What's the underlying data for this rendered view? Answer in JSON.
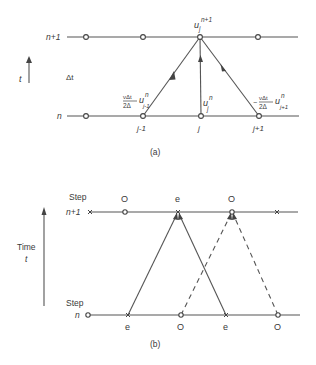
{
  "diagram_a": {
    "caption": "(a)",
    "time_axis_label": "t",
    "delta_label": "Δt",
    "levels": [
      {
        "label": "n+1",
        "y": 37
      },
      {
        "label": "n",
        "y": 116
      }
    ],
    "top_node_label": {
      "base": "u",
      "sub": "j",
      "sup": "n+1"
    },
    "center_node_label": {
      "base": "u",
      "sub": "j",
      "sup": "n"
    },
    "left_coef": {
      "num": "νΔt",
      "den": "2Δ",
      "base": "u",
      "sub": "j-1",
      "sup": "n"
    },
    "right_coef": {
      "sign": "−",
      "num": "νΔt",
      "den": "2Δ",
      "base": "u",
      "sub": "j+1",
      "sup": "n"
    },
    "grid_labels": [
      "j-1",
      "j",
      "j+1"
    ],
    "nodes_top_x": [
      86,
      143,
      200,
      258
    ],
    "nodes_bottom_x": [
      86,
      143,
      201,
      259
    ]
  },
  "diagram_b": {
    "caption": "(b)",
    "time_axis_label": "Time",
    "time_symbol": "t",
    "top_step": {
      "word": "Step",
      "label": "n+1"
    },
    "bottom_step": {
      "word": "Step",
      "label": "n"
    },
    "top_marks": [
      {
        "x": 90,
        "type": "cross",
        "label": ""
      },
      {
        "x": 125,
        "type": "circle",
        "label": "O"
      },
      {
        "x": 178,
        "type": "cross",
        "label": "e"
      },
      {
        "x": 232,
        "type": "circle",
        "label": "O"
      },
      {
        "x": 277,
        "type": "cross",
        "label": ""
      }
    ],
    "bottom_marks": [
      {
        "x": 88,
        "type": "circle",
        "label": ""
      },
      {
        "x": 128,
        "type": "cross",
        "label": "e"
      },
      {
        "x": 181,
        "type": "circle",
        "label": "O"
      },
      {
        "x": 226,
        "type": "cross",
        "label": "e"
      },
      {
        "x": 278,
        "type": "circle",
        "label": "O"
      }
    ],
    "arrows": [
      {
        "from_x": 128,
        "to_x": 178,
        "style": "solid"
      },
      {
        "from_x": 226,
        "to_x": 178,
        "style": "solid"
      },
      {
        "from_x": 181,
        "to_x": 232,
        "style": "dashed"
      },
      {
        "from_x": 278,
        "to_x": 232,
        "style": "dashed"
      }
    ]
  }
}
